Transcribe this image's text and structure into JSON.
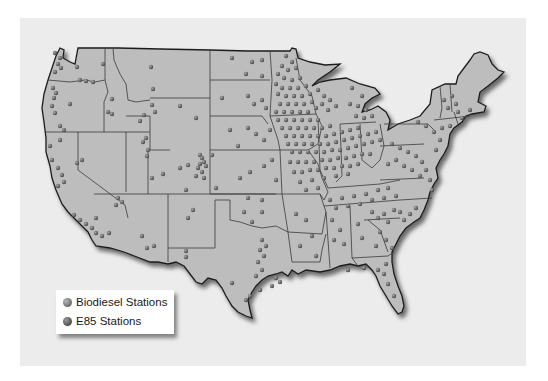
{
  "map": {
    "title": "",
    "region": "Contiguous United States",
    "colors": {
      "background_panel": "#ececec",
      "land": "#bdbdbd",
      "state_border": "#3a3a3a",
      "station_dot": "#6a6a6a"
    }
  },
  "legend": {
    "items": [
      {
        "label": "Biodiesel Stations",
        "icon": "gray-sphere-icon",
        "color": "#7a7a7a"
      },
      {
        "label": "E85 Stations",
        "icon": "dark-sphere-icon",
        "color": "#4c4c4c"
      }
    ]
  }
}
